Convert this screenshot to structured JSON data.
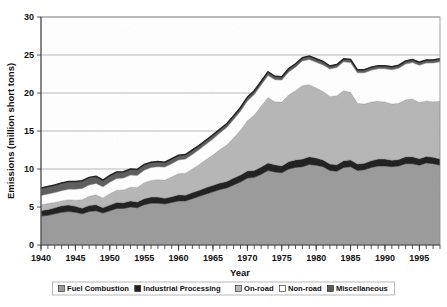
{
  "chart_data": {
    "type": "area",
    "stacked": true,
    "title": "",
    "xlabel": "Year",
    "ylabel": "Emissions (million short tons)",
    "xlim": [
      1940,
      1998
    ],
    "ylim": [
      0,
      30
    ],
    "yticks": [
      0,
      5,
      10,
      15,
      20,
      25,
      30
    ],
    "ytick_labels": [
      "0",
      "5",
      "10",
      "15",
      "20",
      "25",
      "30"
    ],
    "xticks": [
      1940,
      1945,
      1950,
      1955,
      1960,
      1965,
      1970,
      1975,
      1980,
      1985,
      1990,
      1995
    ],
    "xtick_labels": [
      "1940",
      "1945",
      "1950",
      "1955",
      "1960",
      "1965",
      "1970",
      "1975",
      "1980",
      "1985",
      "1990",
      "1995"
    ],
    "minor_xtick_interval": 1,
    "grid": "horizontal",
    "legend_position": "bottom",
    "x": [
      1940,
      1941,
      1942,
      1943,
      1944,
      1945,
      1946,
      1947,
      1948,
      1949,
      1950,
      1951,
      1952,
      1953,
      1954,
      1955,
      1956,
      1957,
      1958,
      1959,
      1960,
      1961,
      1962,
      1963,
      1964,
      1965,
      1966,
      1967,
      1968,
      1969,
      1970,
      1971,
      1972,
      1973,
      1974,
      1975,
      1976,
      1977,
      1978,
      1979,
      1980,
      1981,
      1982,
      1983,
      1984,
      1985,
      1986,
      1987,
      1988,
      1989,
      1990,
      1991,
      1992,
      1993,
      1994,
      1995,
      1996,
      1997,
      1998
    ],
    "series": [
      {
        "name": "Fuel Combustion",
        "color": "#9a9a9a",
        "values": [
          3.8,
          3.9,
          4.1,
          4.3,
          4.4,
          4.3,
          4.1,
          4.4,
          4.5,
          4.2,
          4.5,
          4.8,
          4.8,
          5.0,
          4.9,
          5.3,
          5.5,
          5.5,
          5.4,
          5.6,
          5.8,
          5.8,
          6.1,
          6.4,
          6.7,
          7.0,
          7.3,
          7.5,
          7.9,
          8.3,
          8.8,
          8.9,
          9.3,
          9.8,
          9.6,
          9.5,
          10.0,
          10.2,
          10.3,
          10.6,
          10.5,
          10.3,
          9.8,
          9.7,
          10.2,
          10.3,
          9.8,
          9.9,
          10.2,
          10.4,
          10.4,
          10.3,
          10.4,
          10.7,
          10.7,
          10.5,
          10.8,
          10.7,
          10.5
        ]
      },
      {
        "name": "Industrial Processing",
        "color": "#1e1e1e",
        "values": [
          0.75,
          0.75,
          0.8,
          0.85,
          0.85,
          0.8,
          0.75,
          0.8,
          0.8,
          0.7,
          0.75,
          0.8,
          0.75,
          0.8,
          0.75,
          0.8,
          0.8,
          0.8,
          0.75,
          0.75,
          0.8,
          0.75,
          0.8,
          0.8,
          0.85,
          0.85,
          0.85,
          0.85,
          0.9,
          0.9,
          0.95,
          0.9,
          0.95,
          1.0,
          0.95,
          0.9,
          0.95,
          1.0,
          1.0,
          1.0,
          0.95,
          0.9,
          0.85,
          0.85,
          0.9,
          0.9,
          0.85,
          0.85,
          0.9,
          0.9,
          0.9,
          0.85,
          0.85,
          0.9,
          0.9,
          0.85,
          0.85,
          0.85,
          0.8
        ]
      },
      {
        "name": "On-road",
        "color": "#b6b6b6",
        "values": [
          0.75,
          0.8,
          0.7,
          0.65,
          0.7,
          0.8,
          1.1,
          1.2,
          1.3,
          1.3,
          1.5,
          1.6,
          1.7,
          1.8,
          1.9,
          2.1,
          2.2,
          2.3,
          2.4,
          2.6,
          2.8,
          2.9,
          3.1,
          3.4,
          3.7,
          4.0,
          4.4,
          4.8,
          5.3,
          5.9,
          6.6,
          7.3,
          8.0,
          8.6,
          8.3,
          8.4,
          8.8,
          9.1,
          9.7,
          9.5,
          9.2,
          9.0,
          8.9,
          9.1,
          9.2,
          8.9,
          8.0,
          7.8,
          7.7,
          7.6,
          7.5,
          7.4,
          7.4,
          7.5,
          7.6,
          7.4,
          7.3,
          7.3,
          7.6
        ]
      },
      {
        "name": "Non-road",
        "color": "#ffffff",
        "values": [
          1.2,
          1.25,
          1.3,
          1.35,
          1.4,
          1.45,
          1.5,
          1.5,
          1.5,
          1.45,
          1.5,
          1.55,
          1.55,
          1.6,
          1.6,
          1.65,
          1.7,
          1.7,
          1.7,
          1.75,
          1.8,
          1.85,
          1.9,
          1.95,
          2.0,
          2.1,
          2.2,
          2.3,
          2.4,
          2.5,
          2.6,
          2.7,
          2.8,
          2.9,
          2.9,
          2.9,
          3.0,
          3.1,
          3.2,
          3.3,
          3.4,
          3.5,
          3.6,
          3.7,
          3.8,
          3.9,
          4.0,
          4.1,
          4.2,
          4.3,
          4.4,
          4.5,
          4.6,
          4.7,
          4.8,
          4.9,
          5.0,
          5.1,
          5.2
        ]
      },
      {
        "name": "Miscellaneous",
        "color": "#5c5c5c",
        "values": [
          1.0,
          1.0,
          1.0,
          1.0,
          1.0,
          1.0,
          1.0,
          1.0,
          0.95,
          0.9,
          0.9,
          0.85,
          0.85,
          0.8,
          0.8,
          0.75,
          0.7,
          0.7,
          0.65,
          0.65,
          0.6,
          0.6,
          0.6,
          0.55,
          0.55,
          0.55,
          0.5,
          0.5,
          0.5,
          0.5,
          0.5,
          0.5,
          0.5,
          0.5,
          0.45,
          0.45,
          0.45,
          0.45,
          0.45,
          0.45,
          0.45,
          0.45,
          0.4,
          0.4,
          0.4,
          0.4,
          0.4,
          0.4,
          0.4,
          0.4,
          0.4,
          0.4,
          0.4,
          0.4,
          0.4,
          0.4,
          0.4,
          0.4,
          0.4
        ]
      }
    ],
    "totals_note": "Top boundary peaks near 25 around 1977-1978 and again near 1994-1995"
  },
  "legend": {
    "items": [
      {
        "label": "Fuel Combustion",
        "swatch": "#9a9a9a"
      },
      {
        "label": "Industrial Processing",
        "swatch": "#1e1e1e"
      },
      {
        "label": "On-road",
        "swatch": "#b6b6b6"
      },
      {
        "label": "Non-road",
        "swatch": "#ffffff"
      },
      {
        "label": "Miscellaneous",
        "swatch": "#5c5c5c"
      }
    ]
  }
}
